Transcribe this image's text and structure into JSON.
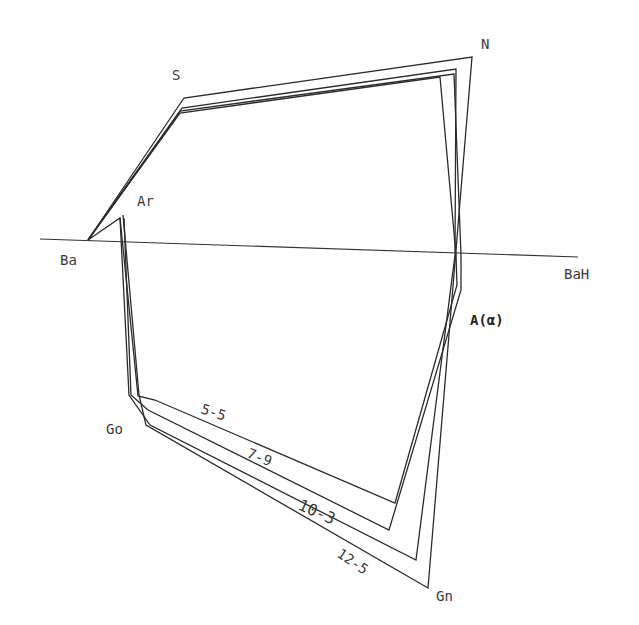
{
  "diagram": {
    "type": "cephalometric-polygon-tracing",
    "reference_line": {
      "from_label": "Ba",
      "to_label": "BaH",
      "x1": 40,
      "y1": 239,
      "x2": 578,
      "y2": 257
    },
    "landmarks": {
      "S": "S",
      "N": "N",
      "Ar": "Ar",
      "Ba": "Ba",
      "BaH": "BaH",
      "A": "A(α)",
      "Go": "Go",
      "Gn": "Gn"
    },
    "labels": [
      {
        "key": "S",
        "text": "S",
        "x": 172,
        "y": 77
      },
      {
        "key": "N",
        "text": "N",
        "x": 481,
        "y": 46
      },
      {
        "key": "Ar",
        "text": "Ar",
        "x": 137,
        "y": 203
      },
      {
        "key": "Ba",
        "text": "Ba",
        "x": 60,
        "y": 262
      },
      {
        "key": "BaH",
        "text": "BaH",
        "x": 564,
        "y": 276
      },
      {
        "key": "A",
        "text": "A(α)",
        "x": 472,
        "y": 322
      },
      {
        "key": "Go",
        "text": "Go",
        "x": 106,
        "y": 432
      },
      {
        "key": "Gn",
        "text": "Gn",
        "x": 435,
        "y": 598
      }
    ],
    "stages": [
      {
        "label": "5-5",
        "label_x": 200,
        "label_y": 412,
        "label_rot": 18
      },
      {
        "label": "7-9",
        "label_x": 245,
        "label_y": 455,
        "label_rot": 22
      },
      {
        "label": "10-3",
        "label_x": 295,
        "label_y": 508,
        "label_rot": 24
      },
      {
        "label": "12-5",
        "label_x": 335,
        "label_y": 557,
        "label_rot": 34
      }
    ]
  }
}
